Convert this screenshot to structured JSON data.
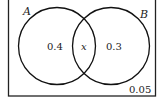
{
  "diagram": {
    "type": "venn",
    "sets": [
      {
        "name": "A",
        "label": "A"
      },
      {
        "name": "B",
        "label": "B"
      }
    ],
    "regions": {
      "a_only": "0.4",
      "intersection": "x",
      "b_only": "0.3",
      "outside": "0.05"
    }
  }
}
